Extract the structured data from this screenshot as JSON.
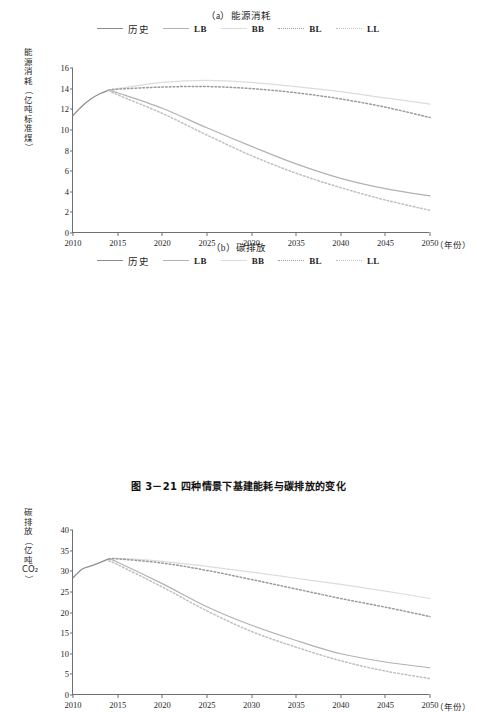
{
  "caption": "图 3－21    四种情景下基建能耗与碳排放的变化",
  "legend": {
    "items": [
      {
        "label": "历史",
        "style": "solid",
        "color": "#8e8e8e",
        "cjk": true
      },
      {
        "label": "LB",
        "style": "solid",
        "color": "#b2b2b2",
        "cjk": false
      },
      {
        "label": "BB",
        "style": "solid",
        "color": "#dcdcdc",
        "cjk": false
      },
      {
        "label": "BL",
        "style": "dotted",
        "color": "#9a9a9a",
        "cjk": false
      },
      {
        "label": "LL",
        "style": "dotted",
        "color": "#c0c0c0",
        "cjk": false
      }
    ]
  },
  "chart_data": [
    {
      "type": "line",
      "id": "a",
      "title": "（a）能源消耗",
      "xlabel": "（年份）",
      "ylabel": "能源消耗（亿吨标准煤）",
      "ylabel_chars": [
        "能",
        "源",
        "消",
        "耗",
        "（",
        "亿",
        "吨",
        "标",
        "准",
        "煤",
        "）"
      ],
      "xlim": [
        2010,
        2050
      ],
      "ylim": [
        0,
        16
      ],
      "yticks": [
        0,
        2,
        4,
        6,
        8,
        10,
        12,
        14,
        16
      ],
      "xticks": [
        2010,
        2015,
        2020,
        2025,
        2030,
        2035,
        2040,
        2045,
        2050
      ],
      "grid": false,
      "legend_position": "top",
      "series": [
        {
          "name": "历史",
          "style": "solid",
          "color": "#8e8e8e",
          "width": 1.3,
          "x": [
            2010,
            2011,
            2012,
            2013,
            2014
          ],
          "values": [
            11.4,
            12.3,
            13.0,
            13.5,
            13.85
          ]
        },
        {
          "name": "LB",
          "style": "solid",
          "color": "#b2b2b2",
          "width": 1.2,
          "x": [
            2014,
            2015,
            2020,
            2025,
            2030,
            2035,
            2040,
            2045,
            2050
          ],
          "values": [
            13.85,
            13.6,
            12.1,
            10.2,
            8.4,
            6.7,
            5.3,
            4.3,
            3.6
          ]
        },
        {
          "name": "BB",
          "style": "solid",
          "color": "#dcdcdc",
          "width": 1.2,
          "x": [
            2014,
            2015,
            2020,
            2025,
            2030,
            2035,
            2040,
            2045,
            2050
          ],
          "values": [
            13.85,
            14.0,
            14.6,
            14.8,
            14.6,
            14.2,
            13.7,
            13.1,
            12.5
          ]
        },
        {
          "name": "BL",
          "style": "dotted",
          "color": "#9a9a9a",
          "width": 1.5,
          "x": [
            2014,
            2015,
            2020,
            2025,
            2030,
            2035,
            2040,
            2045,
            2050
          ],
          "values": [
            13.85,
            13.95,
            14.15,
            14.2,
            14.0,
            13.6,
            13.0,
            12.2,
            11.2
          ]
        },
        {
          "name": "LL",
          "style": "dotted",
          "color": "#c0c0c0",
          "width": 1.5,
          "x": [
            2014,
            2015,
            2020,
            2025,
            2030,
            2035,
            2040,
            2045,
            2050
          ],
          "values": [
            13.85,
            13.4,
            11.6,
            9.5,
            7.5,
            5.8,
            4.4,
            3.2,
            2.2
          ]
        }
      ]
    },
    {
      "type": "line",
      "id": "b",
      "title": "（b）碳排放",
      "xlabel": "（年份）",
      "ylabel": "碳排放（亿吨CO₂）",
      "ylabel_chars": [
        "碳",
        "排",
        "放",
        "（",
        "亿",
        "吨",
        "CO₂",
        "）"
      ],
      "xlim": [
        2010,
        2050
      ],
      "ylim": [
        0,
        40
      ],
      "yticks": [
        0,
        5,
        10,
        15,
        20,
        25,
        30,
        35,
        40
      ],
      "xticks": [
        2010,
        2015,
        2020,
        2025,
        2030,
        2035,
        2040,
        2045,
        2050
      ],
      "grid": false,
      "legend_position": "top",
      "series": [
        {
          "name": "历史",
          "style": "solid",
          "color": "#8e8e8e",
          "width": 1.3,
          "x": [
            2010,
            2011,
            2012,
            2013,
            2014
          ],
          "values": [
            28.4,
            30.5,
            31.3,
            32.1,
            33.0
          ]
        },
        {
          "name": "LB",
          "style": "solid",
          "color": "#b2b2b2",
          "width": 1.2,
          "x": [
            2014,
            2015,
            2020,
            2025,
            2030,
            2035,
            2040,
            2045,
            2050
          ],
          "values": [
            33.0,
            32.2,
            27.0,
            21.4,
            16.9,
            13.2,
            10.0,
            8.0,
            6.6
          ]
        },
        {
          "name": "BB",
          "style": "solid",
          "color": "#dcdcdc",
          "width": 1.2,
          "x": [
            2014,
            2015,
            2020,
            2025,
            2030,
            2035,
            2040,
            2045,
            2050
          ],
          "values": [
            33.0,
            33.1,
            32.4,
            31.2,
            29.8,
            28.3,
            26.8,
            25.2,
            23.4
          ]
        },
        {
          "name": "BL",
          "style": "dotted",
          "color": "#9a9a9a",
          "width": 1.5,
          "x": [
            2014,
            2015,
            2020,
            2025,
            2030,
            2035,
            2040,
            2045,
            2050
          ],
          "values": [
            33.0,
            33.0,
            32.0,
            30.2,
            28.0,
            25.7,
            23.4,
            21.3,
            19.0
          ]
        },
        {
          "name": "LL",
          "style": "dotted",
          "color": "#c0c0c0",
          "width": 1.5,
          "x": [
            2014,
            2015,
            2020,
            2025,
            2030,
            2035,
            2040,
            2045,
            2050
          ],
          "values": [
            32.5,
            31.6,
            26.2,
            20.4,
            15.4,
            11.6,
            8.3,
            5.8,
            4.0
          ]
        }
      ]
    }
  ]
}
